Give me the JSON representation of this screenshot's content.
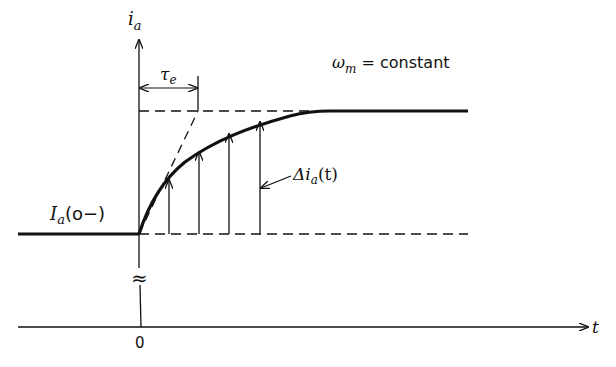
{
  "diagram": {
    "type": "step-response",
    "y_axis_label_main": "i",
    "y_axis_label_sub": "a",
    "x_axis_label": "t",
    "origin_label": "0",
    "time_constant_main": "τ",
    "time_constant_sub": "e",
    "condition_main": "ω",
    "condition_sub": "m",
    "condition_rest": " = constant",
    "initial_current_main": "I",
    "initial_current_sub": "a",
    "initial_current_rest": "(o−)",
    "delta_main": "Δi",
    "delta_sub": "a",
    "delta_rest": "(t)",
    "axis_break_symbol": "≈",
    "colors": {
      "ink": "#111111",
      "background": "#ffffff"
    }
  }
}
